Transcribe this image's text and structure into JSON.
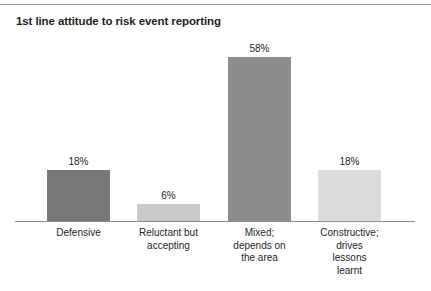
{
  "chart_data": {
    "type": "bar",
    "title": "1st line attitude to risk event reporting",
    "xlabel": "",
    "ylabel": "",
    "ylim": [
      0,
      64
    ],
    "grid": false,
    "legend": "none",
    "value_suffix": "%",
    "categories": [
      "Defensive",
      "Reluctant but accepting",
      "Mixed; depends on the area",
      "Constructive; drives lessons learnt"
    ],
    "category_lines": [
      [
        "Defensive"
      ],
      [
        "Reluctant but",
        "accepting"
      ],
      [
        "Mixed;",
        "depends on",
        "the area"
      ],
      [
        "Constructive;",
        "drives",
        "lessons",
        "learnt"
      ]
    ],
    "values": [
      18,
      6,
      58,
      18
    ],
    "value_labels": [
      "18%",
      "6%",
      "58%",
      "18%"
    ],
    "bar_colors": [
      "#787878",
      "#c9c9c9",
      "#8d8d8d",
      "#dcdcdc"
    ],
    "axis_color": "#8c8c8c",
    "rule_color": "#9a9a9a",
    "text_color": "#231f20",
    "background": "#ffffff"
  }
}
